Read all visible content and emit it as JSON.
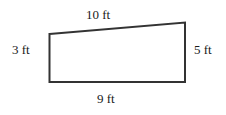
{
  "diagram": {
    "type": "quadrilateral-trapezoid",
    "stroke_color": "#333333",
    "stroke_width": 2,
    "vertices": {
      "top_left": [
        49.5,
        34
      ],
      "top_right": [
        185,
        22.5
      ],
      "bottom_right": [
        185,
        82
      ],
      "bottom_left": [
        49.5,
        82
      ]
    },
    "labels": {
      "top": "10 ft",
      "left": "3 ft",
      "right": "5 ft",
      "bottom": "9 ft"
    }
  }
}
